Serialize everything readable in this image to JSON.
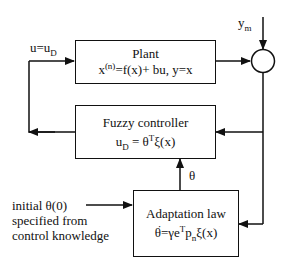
{
  "diagram": {
    "type": "block-diagram",
    "blocks": {
      "plant": {
        "title": "Plant",
        "eq_x": "x",
        "eq_sup": "(n)",
        "eq_rest": "=f(x)+ bu, y=x"
      },
      "fuzzy_controller": {
        "title": "Fuzzy controller",
        "eq_u": "u",
        "eq_sub": "D",
        "eq_mid": " = θ",
        "eq_sup": "T",
        "eq_rest": "ξ(x)"
      },
      "adaptation_law": {
        "title": "Adaptation law",
        "eq_theta": "θ",
        "eq_mid": "=γe",
        "eq_sup": "T",
        "eq_p": "p",
        "eq_sub": "n",
        "eq_rest": "ξ(x)"
      }
    },
    "signals": {
      "control_input_main": "u=u",
      "control_input_sub": "D",
      "reference_main": "y",
      "reference_sub": "m",
      "parameter": "θ"
    },
    "annotation": {
      "line1": "initial θ(0)",
      "line2": "specified from",
      "line3": "control knowledge"
    },
    "summing_junction": "circle"
  }
}
